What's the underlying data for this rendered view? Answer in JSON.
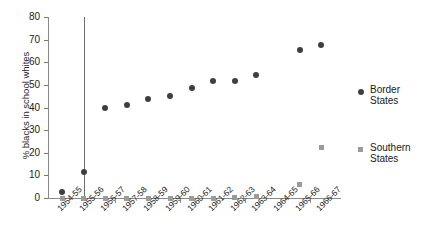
{
  "chart_data": {
    "type": "scatter",
    "title": "",
    "xlabel": "",
    "ylabel": "% blacks in school whites",
    "ylim": [
      0,
      80
    ],
    "ytick_values": [
      0,
      10,
      20,
      30,
      40,
      50,
      60,
      70,
      80
    ],
    "ytick_labels": [
      "0",
      "10",
      "20",
      "30",
      "40",
      "50",
      "60",
      "70",
      "80"
    ],
    "grid": false,
    "legend_position": "right",
    "categories": [
      "1954-55",
      "1955-56",
      "1956-57",
      "1957-58",
      "1958-59",
      "1959-60",
      "1960-61",
      "1961-62",
      "1962-63",
      "1963-64",
      "1964-65",
      "1965-66",
      "1966-67"
    ],
    "series": [
      {
        "name": "Border States",
        "marker": "circle",
        "color": "#3f3f3f",
        "values": [
          2.8,
          11.5,
          39.8,
          41.2,
          43.9,
          44.9,
          48.6,
          51.8,
          51.5,
          54.3,
          null,
          65.5,
          67.5
        ]
      },
      {
        "name": "Southern States",
        "marker": "square",
        "color": "#9b9b9b",
        "values": [
          0.0,
          0.0,
          0.0,
          0.0,
          0.0,
          0.0,
          0.0,
          0.0,
          0.2,
          0.6,
          null,
          6.1,
          22.2
        ]
      }
    ],
    "annotations": [
      {
        "type": "vline",
        "category": "1955-56",
        "color": "#6e6e6e"
      }
    ]
  },
  "legend": {
    "entries": [
      {
        "label_line1": "Border",
        "label_line2": "States"
      },
      {
        "label_line1": "Southern",
        "label_line2": "States"
      }
    ]
  }
}
